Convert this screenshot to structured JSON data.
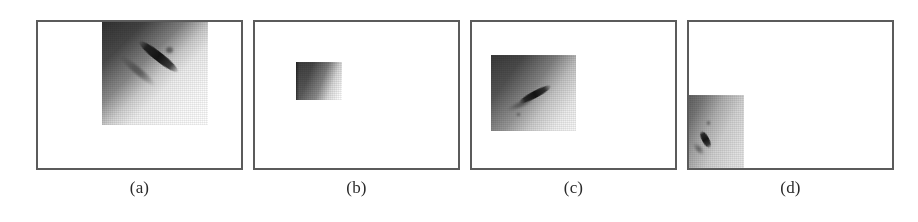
{
  "figure": {
    "background_color": "#ffffff",
    "frame_border_color": "#5b5b5b",
    "caption_color": "#2b2b2b",
    "panel_count": 4
  },
  "panels": [
    {
      "id": "a",
      "caption": "(a)",
      "image_alt": "grayscale scan patch with diagonal bright-to-dark ramp and dark elongated streak",
      "patch_size": "large",
      "patch_position": "upper-right of frame"
    },
    {
      "id": "b",
      "caption": "(b)",
      "image_alt": "small grayscale scan patch, dark left side fading to light right side",
      "patch_size": "small",
      "patch_position": "center-left of frame"
    },
    {
      "id": "c",
      "caption": "(c)",
      "image_alt": "medium grayscale scan patch with dark diagonal streak near center",
      "patch_size": "medium",
      "patch_position": "left of center of frame"
    },
    {
      "id": "d",
      "caption": "(d)",
      "image_alt": "grayscale scan patch anchored at the bottom-left corner of the frame, clipped",
      "patch_size": "small-tall",
      "patch_position": "bottom-left corner of frame"
    }
  ]
}
